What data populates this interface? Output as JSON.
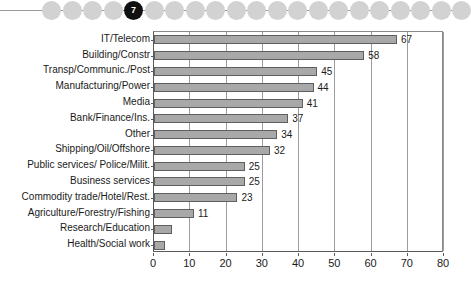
{
  "bead_strip": {
    "name": "page-step-indicator",
    "current_label": "7",
    "current_index": 4,
    "total_beads": 21,
    "bead_color": "#d2d2d2",
    "current_color": "#101010",
    "line_color": "#9a9a9a"
  },
  "chart_data": {
    "type": "bar",
    "orientation": "horizontal",
    "title": "",
    "xlabel": "",
    "ylabel": "",
    "xlim": [
      0,
      80
    ],
    "xticks": [
      0,
      10,
      20,
      30,
      40,
      50,
      60,
      70,
      80
    ],
    "grid": true,
    "legend": false,
    "bar_color": "#a8a8a8",
    "bar_border_color": "#5f5f5f",
    "categories": [
      "IT/Telecom",
      "Building/Constr",
      "Transp/Communic./Post",
      "Manufacturing/Power",
      "Media",
      "Bank/Finance/Ins.",
      "Other",
      "Shipping/Oil/Offshore",
      "Public services/ Police/Milit.",
      "Business services",
      "Commodity trade/Hotel/Rest.",
      "Agriculture/Forestry/Fishing",
      "Research/Education",
      "Health/Social work"
    ],
    "values": [
      67,
      58,
      45,
      44,
      41,
      37,
      34,
      32,
      25,
      25,
      23,
      11,
      5,
      3
    ],
    "value_labels": [
      "67",
      "58",
      "45",
      "44",
      "41",
      "37",
      "34",
      "32",
      "25",
      "25",
      "23",
      "11",
      "",
      ""
    ]
  }
}
